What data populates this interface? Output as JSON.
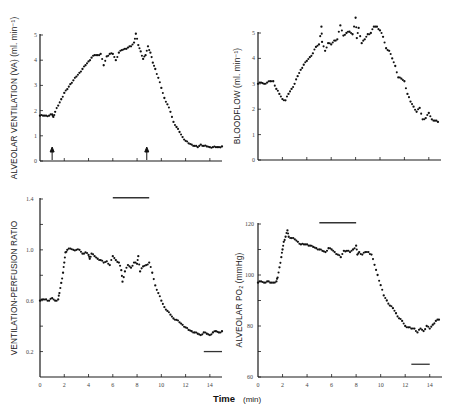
{
  "figure": {
    "xlabel_main": "Time",
    "xlabel_unit": "(min)"
  },
  "chart_data": [
    {
      "id": "ventilation",
      "type": "scatter",
      "title": "",
      "ylabel": "ALVEOLAR VENTILATION (VA) (ml. min⁻¹)",
      "xlabel": "Time (min)",
      "xlim": [
        0,
        15
      ],
      "ylim": [
        0,
        5
      ],
      "yticks": [
        0,
        1,
        2,
        3,
        4,
        5
      ],
      "ytick_labels": [
        "0",
        "1",
        "2",
        "3",
        "4",
        "5"
      ],
      "xticks": [
        0,
        2,
        4,
        6,
        8,
        10,
        12,
        14
      ],
      "xtick_labels": [],
      "annotations": [
        {
          "type": "arrow-up",
          "x": 1.0,
          "label": "start"
        },
        {
          "type": "arrow-up",
          "x": 8.8,
          "label": "stop"
        }
      ],
      "bars": [],
      "x": [
        0,
        0.25,
        0.5,
        0.75,
        1.0,
        1.1,
        1.25,
        1.5,
        1.75,
        2.0,
        2.25,
        2.5,
        2.75,
        3.0,
        3.25,
        3.5,
        3.75,
        4.0,
        4.25,
        4.5,
        4.75,
        5.0,
        5.25,
        5.5,
        5.75,
        6.0,
        6.25,
        6.5,
        6.75,
        7.0,
        7.25,
        7.5,
        7.75,
        7.9,
        8.1,
        8.3,
        8.5,
        8.7,
        8.9,
        9.1,
        9.3,
        9.5,
        9.75,
        10.0,
        10.25,
        10.5,
        10.75,
        11.0,
        11.25,
        11.5,
        11.75,
        12.0,
        12.25,
        12.5,
        12.75,
        13.0,
        13.25,
        13.5,
        13.75,
        14.0,
        14.25,
        14.5,
        14.75,
        15.0
      ],
      "y": [
        1.8,
        1.8,
        1.8,
        1.8,
        1.85,
        1.75,
        1.95,
        2.2,
        2.45,
        2.7,
        2.85,
        3.05,
        3.2,
        3.35,
        3.5,
        3.65,
        3.8,
        3.95,
        4.1,
        4.2,
        4.2,
        4.25,
        3.8,
        4.15,
        4.25,
        4.25,
        4.0,
        4.3,
        4.4,
        4.45,
        4.5,
        4.55,
        4.7,
        5.05,
        4.6,
        4.35,
        4.05,
        4.2,
        4.55,
        4.3,
        3.9,
        3.65,
        3.3,
        2.9,
        2.5,
        2.25,
        1.95,
        1.55,
        1.35,
        1.15,
        0.95,
        0.8,
        0.7,
        0.65,
        0.6,
        0.55,
        0.65,
        0.6,
        0.58,
        0.55,
        0.55,
        0.55,
        0.55,
        0.58
      ]
    },
    {
      "id": "bloodflow",
      "type": "scatter",
      "title": "",
      "ylabel": "BLOODFLOW (ml. min⁻¹)",
      "xlabel": "Time (min)",
      "xlim": [
        0,
        15
      ],
      "ylim": [
        0,
        5
      ],
      "yticks": [
        0,
        1,
        2,
        3,
        4,
        5
      ],
      "ytick_labels": [
        "0",
        "1",
        "2",
        "3",
        "4",
        "5"
      ],
      "xticks": [
        0,
        2,
        4,
        6,
        8,
        10,
        12,
        14
      ],
      "xtick_labels": [],
      "annotations": [],
      "bars": [],
      "x": [
        0,
        0.25,
        0.5,
        0.75,
        1.0,
        1.25,
        1.5,
        1.75,
        2.0,
        2.25,
        2.5,
        2.75,
        3.0,
        3.25,
        3.5,
        3.75,
        4.0,
        4.25,
        4.5,
        4.75,
        5.0,
        5.2,
        5.25,
        5.5,
        5.75,
        6.0,
        6.25,
        6.5,
        6.75,
        7.0,
        7.25,
        7.5,
        7.75,
        8.0,
        8.1,
        8.25,
        8.5,
        8.75,
        9.0,
        9.25,
        9.5,
        9.75,
        10.0,
        10.25,
        10.5,
        10.75,
        11.0,
        11.25,
        11.5,
        11.75,
        12.0,
        12.25,
        12.5,
        12.75,
        13.0,
        13.25,
        13.5,
        13.75,
        14.0,
        14.25,
        14.5,
        14.75
      ],
      "y": [
        3.0,
        3.05,
        3.0,
        3.05,
        3.1,
        3.1,
        2.8,
        2.6,
        2.4,
        2.35,
        2.6,
        2.8,
        3.0,
        3.3,
        3.55,
        3.75,
        3.9,
        4.05,
        4.2,
        4.45,
        4.55,
        5.25,
        4.65,
        4.3,
        4.6,
        4.55,
        4.7,
        4.75,
        5.3,
        4.9,
        5.0,
        5.05,
        4.95,
        5.6,
        4.8,
        5.2,
        4.6,
        4.75,
        4.95,
        5.0,
        5.25,
        5.25,
        5.1,
        4.85,
        4.4,
        4.3,
        4.0,
        3.7,
        3.25,
        3.2,
        3.1,
        2.6,
        2.3,
        2.1,
        1.9,
        2.05,
        1.6,
        1.65,
        1.85,
        1.6,
        1.55,
        1.5
      ]
    },
    {
      "id": "va-q-ratio",
      "type": "scatter",
      "title": "",
      "ylabel": "VENTILATION-PERFUSION RATIO",
      "xlabel": "Time (min)",
      "xlim": [
        0,
        15
      ],
      "ylim": [
        0,
        1.4
      ],
      "yticks": [
        0.2,
        0.4,
        0.6,
        0.8,
        1.0,
        1.2,
        1.4
      ],
      "ytick_labels": [
        "0.2",
        "",
        "0.6",
        "",
        "1.0",
        "",
        "1.4"
      ],
      "xticks": [
        0,
        2,
        4,
        6,
        8,
        10,
        12,
        14
      ],
      "xtick_labels": [
        "0",
        "2",
        "4",
        "6",
        "8",
        "10",
        "12",
        "14"
      ],
      "annotations": [],
      "bars": [
        {
          "x0": 6.0,
          "x1": 9.0,
          "y": 1.41
        },
        {
          "x0": 13.5,
          "x1": 15.0,
          "y": 0.2
        }
      ],
      "x": [
        0,
        0.25,
        0.5,
        0.75,
        1.0,
        1.25,
        1.5,
        1.6,
        1.75,
        1.9,
        2.0,
        2.1,
        2.25,
        2.5,
        2.75,
        3.0,
        3.25,
        3.5,
        3.75,
        4.0,
        4.1,
        4.25,
        4.5,
        4.75,
        5.0,
        5.25,
        5.5,
        5.75,
        6.0,
        6.25,
        6.5,
        6.7,
        6.8,
        7.0,
        7.25,
        7.5,
        7.75,
        8.0,
        8.1,
        8.25,
        8.5,
        8.75,
        9.0,
        9.25,
        9.5,
        9.75,
        10.0,
        10.25,
        10.5,
        10.75,
        11.0,
        11.25,
        11.5,
        11.75,
        12.0,
        12.25,
        12.5,
        12.75,
        13.0,
        13.25,
        13.5,
        13.75,
        14.0,
        14.25,
        14.5,
        14.75,
        15.0
      ],
      "y": [
        0.6,
        0.61,
        0.61,
        0.6,
        0.62,
        0.6,
        0.61,
        0.66,
        0.74,
        0.82,
        0.9,
        0.98,
        1.0,
        1.01,
        1.0,
        1.0,
        1.0,
        0.97,
        0.98,
        0.96,
        0.93,
        0.97,
        0.95,
        0.93,
        0.92,
        0.9,
        0.91,
        0.88,
        0.95,
        0.92,
        0.9,
        0.84,
        0.75,
        0.83,
        0.88,
        0.86,
        0.9,
        0.89,
        0.95,
        0.83,
        0.87,
        0.88,
        0.9,
        0.82,
        0.72,
        0.66,
        0.6,
        0.55,
        0.52,
        0.49,
        0.46,
        0.45,
        0.43,
        0.41,
        0.39,
        0.37,
        0.36,
        0.35,
        0.34,
        0.33,
        0.35,
        0.34,
        0.33,
        0.35,
        0.36,
        0.35,
        0.36
      ]
    },
    {
      "id": "alveolar-po2",
      "type": "scatter",
      "title": "",
      "ylabel": "ALVEOLAR PO₂ (mmHg)",
      "xlabel": "Time (min)",
      "xlim": [
        0,
        15
      ],
      "ylim": [
        60,
        120
      ],
      "yticks": [
        60,
        70,
        80,
        90,
        100,
        110,
        120
      ],
      "ytick_labels": [
        "60",
        "",
        "80",
        "",
        "100",
        "",
        "120"
      ],
      "xticks": [
        0,
        2,
        4,
        6,
        8,
        10,
        12,
        14
      ],
      "xtick_labels": [
        "0",
        "2",
        "4",
        "6",
        "8",
        "10",
        "12",
        "14"
      ],
      "annotations": [],
      "bars": [
        {
          "x0": 5.0,
          "x1": 8.0,
          "y": 120.5
        },
        {
          "x0": 12.5,
          "x1": 14.0,
          "y": 65
        }
      ],
      "x": [
        0,
        0.25,
        0.5,
        0.75,
        1.0,
        1.25,
        1.5,
        1.6,
        1.75,
        1.9,
        2.0,
        2.1,
        2.25,
        2.4,
        2.5,
        2.75,
        3.0,
        3.25,
        3.5,
        3.75,
        4.0,
        4.25,
        4.5,
        4.75,
        5.0,
        5.25,
        5.5,
        5.75,
        6.0,
        6.25,
        6.5,
        6.75,
        7.0,
        7.25,
        7.5,
        7.75,
        8.0,
        8.1,
        8.25,
        8.5,
        8.75,
        9.0,
        9.25,
        9.5,
        9.75,
        10.0,
        10.25,
        10.5,
        10.75,
        11.0,
        11.25,
        11.5,
        11.75,
        12.0,
        12.25,
        12.5,
        12.75,
        13.0,
        13.25,
        13.5,
        13.75,
        14.0,
        14.25,
        14.5,
        14.75
      ],
      "y": [
        97,
        97.5,
        97,
        97.5,
        97,
        97,
        97.5,
        99,
        103,
        107,
        110,
        113,
        115,
        117.5,
        115,
        114.5,
        114,
        113,
        112,
        112,
        112,
        111.5,
        111,
        110.5,
        110,
        109.5,
        109,
        110.5,
        110,
        109,
        108,
        107,
        109.5,
        109.5,
        109,
        110,
        111.5,
        108,
        109,
        108,
        109,
        109,
        108,
        104,
        100,
        96,
        92,
        90,
        88,
        87,
        85,
        83,
        82,
        80,
        79.5,
        79,
        79,
        77.5,
        79,
        78,
        80,
        79,
        80.5,
        82,
        82.5
      ]
    }
  ]
}
